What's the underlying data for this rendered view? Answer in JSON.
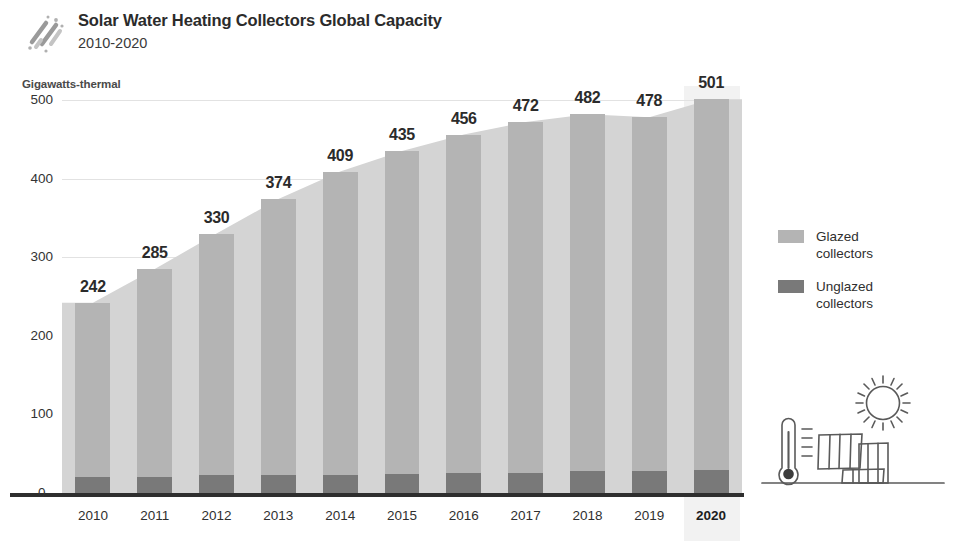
{
  "header": {
    "logo_icon": "diagonal-strokes-logo",
    "title": "Solar Water Heating Collectors Global Capacity",
    "subtitle": "2010-2020"
  },
  "legend": {
    "position": "right",
    "items": [
      {
        "label": "Glazed\ncollectors",
        "color": "#b4b4b4",
        "swatch_icon": "legend-swatch-glazed"
      },
      {
        "label": "Unglazed\ncollectors",
        "color": "#797979",
        "swatch_icon": "legend-swatch-unglazed"
      }
    ]
  },
  "illustration": {
    "sun_icon": "sun-icon",
    "thermometer_icon": "thermometer-icon",
    "panels_icon": "solar-collector-panels-icon",
    "ground_icon": "ground-line-icon",
    "stroke_color": "#5a5a5a"
  },
  "chart_data": {
    "type": "bar",
    "title": "Solar Water Heating Collectors Global Capacity",
    "subtitle": "2010-2020",
    "xlabel": "",
    "ylabel": "Gigawatts-thermal",
    "ylim": [
      0,
      500
    ],
    "yticks": [
      0,
      100,
      200,
      300,
      400,
      500
    ],
    "grid": true,
    "categories": [
      "2010",
      "2011",
      "2012",
      "2013",
      "2014",
      "2015",
      "2016",
      "2017",
      "2018",
      "2019",
      "2020"
    ],
    "highlight_category": "2020",
    "values": [
      242,
      285,
      330,
      374,
      409,
      435,
      456,
      472,
      482,
      478,
      501
    ],
    "data_labels": [
      "242",
      "285",
      "330",
      "374",
      "409",
      "435",
      "456",
      "472",
      "482",
      "478",
      "501"
    ],
    "series": [
      {
        "name": "Unglazed collectors",
        "color": "#797979",
        "values": [
          21,
          21,
          23,
          23,
          23,
          24,
          25,
          26,
          28,
          28,
          29
        ]
      },
      {
        "name": "Glazed collectors",
        "color": "#b4b4b4",
        "values": [
          221,
          264,
          307,
          351,
          386,
          411,
          431,
          446,
          454,
          450,
          472
        ]
      }
    ],
    "area_fill_color": "#d4d4d4"
  }
}
